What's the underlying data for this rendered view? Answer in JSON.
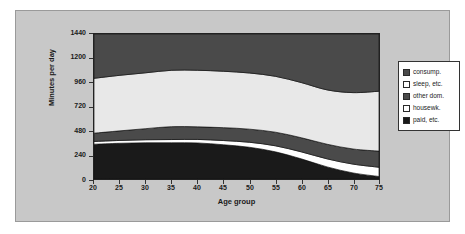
{
  "chart_data": {
    "type": "area",
    "title": "",
    "xlabel": "Age group",
    "ylabel": "Minutes per day",
    "xlim": [
      20,
      75
    ],
    "ylim": [
      0,
      1440
    ],
    "xticks": [
      20,
      25,
      30,
      35,
      40,
      45,
      50,
      55,
      60,
      65,
      70,
      75
    ],
    "yticks": [
      0,
      240,
      480,
      720,
      960,
      1200,
      1440
    ],
    "grid": false,
    "stacked": true,
    "legend_position": "right",
    "x": [
      20,
      25,
      30,
      35,
      40,
      45,
      50,
      55,
      60,
      65,
      70,
      75
    ],
    "series": [
      {
        "name": "paid, etc.",
        "color": "#1a1a1a",
        "values": [
          345,
          355,
          360,
          360,
          358,
          340,
          315,
          270,
          200,
          120,
          60,
          25
        ]
      },
      {
        "name": "housewk.",
        "color": "#ffffff",
        "values": [
          28,
          28,
          30,
          32,
          35,
          42,
          50,
          60,
          70,
          80,
          88,
          92
        ]
      },
      {
        "name": "other dom.",
        "color": "#4a4a4a",
        "values": [
          82,
          95,
          110,
          128,
          125,
          128,
          130,
          135,
          140,
          145,
          150,
          160
        ]
      },
      {
        "name": "sleep, etc.",
        "color": "#e8e8e8",
        "values": [
          545,
          552,
          555,
          560,
          562,
          560,
          558,
          555,
          548,
          540,
          560,
          595
        ]
      },
      {
        "name": "consump.",
        "color": "#4a4a4a",
        "values": [
          440,
          410,
          385,
          360,
          360,
          370,
          387,
          420,
          482,
          555,
          582,
          568
        ]
      }
    ]
  },
  "axes": {
    "y_tick_labels": [
      "1440",
      "1200",
      "960",
      "720",
      "480",
      "240",
      "0"
    ],
    "x_tick_labels": [
      "20",
      "25",
      "30",
      "35",
      "40",
      "45",
      "50",
      "55",
      "60",
      "65",
      "70",
      "75"
    ],
    "y_title": "Minutes per day",
    "x_title": "Age group"
  },
  "legend": {
    "items": [
      {
        "label": "consump.",
        "color": "#4a4a4a"
      },
      {
        "label": "sleep, etc.",
        "color": "#ffffff"
      },
      {
        "label": "other dom.",
        "color": "#4a4a4a"
      },
      {
        "label": "housewk.",
        "color": "#ffffff"
      },
      {
        "label": "paid, etc.",
        "color": "#1a1a1a"
      }
    ]
  },
  "colors": {
    "chart_background": "#c8c8c8",
    "plot_background": "#ffffff",
    "axis": "#222222",
    "text": "#1a1a1a"
  }
}
